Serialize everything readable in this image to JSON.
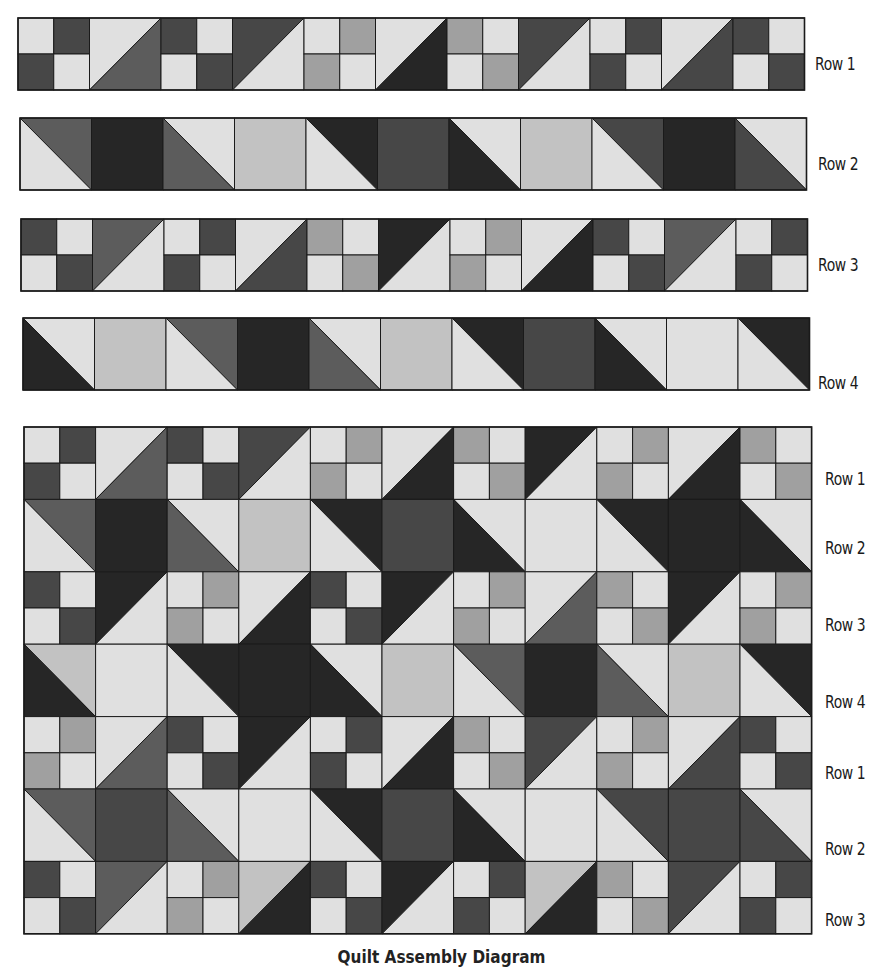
{
  "colors": {
    "L": "#e0e0e0",
    "S": "#c2c2c2",
    "M": "#a0a0a0",
    "G": "#5c5c5c",
    "D": "#474747",
    "K": "#262626",
    "outline": "#1a1a1a"
  },
  "strips": [
    {
      "label": "Row 1",
      "x": 18,
      "y": 18,
      "block": 71.5,
      "height": 72,
      "label_x": 815,
      "label_y": 66,
      "blocks": [
        {
          "t": "4p",
          "c": [
            "L",
            "D",
            "D",
            "L"
          ]
        },
        {
          "t": "hu",
          "c": [
            "L",
            "G"
          ]
        },
        {
          "t": "4p",
          "c": [
            "D",
            "L",
            "L",
            "D"
          ]
        },
        {
          "t": "hu",
          "c": [
            "D",
            "L"
          ]
        },
        {
          "t": "4p",
          "c": [
            "L",
            "M",
            "M",
            "L"
          ]
        },
        {
          "t": "hu",
          "c": [
            "L",
            "K"
          ]
        },
        {
          "t": "4p",
          "c": [
            "M",
            "L",
            "L",
            "M"
          ]
        },
        {
          "t": "hu",
          "c": [
            "D",
            "L"
          ]
        },
        {
          "t": "4p",
          "c": [
            "L",
            "D",
            "D",
            "L"
          ]
        },
        {
          "t": "hu",
          "c": [
            "L",
            "D"
          ]
        },
        {
          "t": "4p",
          "c": [
            "D",
            "L",
            "L",
            "D"
          ]
        }
      ]
    },
    {
      "label": "Row 2",
      "x": 20,
      "y": 118,
      "block": 71.5,
      "height": 72,
      "label_x": 818,
      "label_y": 166,
      "blocks": [
        {
          "t": "hd",
          "c": [
            "G",
            "L"
          ]
        },
        {
          "t": "sq",
          "c": [
            "K"
          ]
        },
        {
          "t": "hd",
          "c": [
            "L",
            "G"
          ]
        },
        {
          "t": "sq",
          "c": [
            "S"
          ]
        },
        {
          "t": "hd",
          "c": [
            "K",
            "L"
          ]
        },
        {
          "t": "sq",
          "c": [
            "D"
          ]
        },
        {
          "t": "hd",
          "c": [
            "L",
            "K"
          ]
        },
        {
          "t": "sq",
          "c": [
            "S"
          ]
        },
        {
          "t": "hd",
          "c": [
            "D",
            "L"
          ]
        },
        {
          "t": "sq",
          "c": [
            "K"
          ]
        },
        {
          "t": "hd",
          "c": [
            "L",
            "D"
          ]
        }
      ]
    },
    {
      "label": "Row 3",
      "x": 21,
      "y": 219,
      "block": 71.5,
      "height": 72,
      "label_x": 818,
      "label_y": 267,
      "blocks": [
        {
          "t": "4p",
          "c": [
            "D",
            "L",
            "L",
            "D"
          ]
        },
        {
          "t": "hu",
          "c": [
            "G",
            "L"
          ]
        },
        {
          "t": "4p",
          "c": [
            "L",
            "D",
            "D",
            "L"
          ]
        },
        {
          "t": "hu",
          "c": [
            "L",
            "D"
          ]
        },
        {
          "t": "4p",
          "c": [
            "M",
            "L",
            "L",
            "M"
          ]
        },
        {
          "t": "hu",
          "c": [
            "K",
            "L"
          ]
        },
        {
          "t": "4p",
          "c": [
            "L",
            "M",
            "M",
            "L"
          ]
        },
        {
          "t": "hu",
          "c": [
            "L",
            "K"
          ]
        },
        {
          "t": "4p",
          "c": [
            "D",
            "L",
            "L",
            "D"
          ]
        },
        {
          "t": "hu",
          "c": [
            "G",
            "L"
          ]
        },
        {
          "t": "4p",
          "c": [
            "L",
            "D",
            "D",
            "L"
          ]
        }
      ]
    },
    {
      "label": "Row 4",
      "x": 23,
      "y": 318,
      "block": 71.5,
      "height": 72,
      "label_x": 818,
      "label_y": 385,
      "blocks": [
        {
          "t": "hd",
          "c": [
            "L",
            "K"
          ]
        },
        {
          "t": "sq",
          "c": [
            "S"
          ]
        },
        {
          "t": "hd",
          "c": [
            "G",
            "L"
          ]
        },
        {
          "t": "sq",
          "c": [
            "K"
          ]
        },
        {
          "t": "hd",
          "c": [
            "L",
            "G"
          ]
        },
        {
          "t": "sq",
          "c": [
            "S"
          ]
        },
        {
          "t": "hd",
          "c": [
            "K",
            "L"
          ]
        },
        {
          "t": "sq",
          "c": [
            "D"
          ]
        },
        {
          "t": "hd",
          "c": [
            "L",
            "K"
          ]
        },
        {
          "t": "sq",
          "c": [
            "L"
          ]
        },
        {
          "t": "hd",
          "c": [
            "K",
            "L"
          ]
        }
      ]
    }
  ],
  "quilt": {
    "x": 24,
    "y": 427,
    "block": 71.6,
    "row_height": 72.4,
    "labels": [
      {
        "text": "Row 1",
        "y": 481
      },
      {
        "text": "Row 2",
        "y": 550
      },
      {
        "text": "Row 3",
        "y": 627
      },
      {
        "text": "Row 4",
        "y": 704
      },
      {
        "text": "Row 1",
        "y": 775
      },
      {
        "text": "Row 2",
        "y": 851
      },
      {
        "text": "Row 3",
        "y": 922
      }
    ],
    "label_x": 825,
    "rows": [
      [
        {
          "t": "4p",
          "c": [
            "L",
            "D",
            "D",
            "L"
          ]
        },
        {
          "t": "hu",
          "c": [
            "L",
            "G"
          ]
        },
        {
          "t": "4p",
          "c": [
            "D",
            "L",
            "L",
            "D"
          ]
        },
        {
          "t": "hu",
          "c": [
            "D",
            "L"
          ]
        },
        {
          "t": "4p",
          "c": [
            "L",
            "M",
            "M",
            "L"
          ]
        },
        {
          "t": "hu",
          "c": [
            "L",
            "K"
          ]
        },
        {
          "t": "4p",
          "c": [
            "M",
            "L",
            "L",
            "M"
          ]
        },
        {
          "t": "hu",
          "c": [
            "K",
            "L"
          ]
        },
        {
          "t": "4p",
          "c": [
            "L",
            "M",
            "M",
            "L"
          ]
        },
        {
          "t": "hu",
          "c": [
            "L",
            "K"
          ]
        },
        {
          "t": "4p",
          "c": [
            "M",
            "L",
            "L",
            "M"
          ]
        }
      ],
      [
        {
          "t": "hd",
          "c": [
            "G",
            "L"
          ]
        },
        {
          "t": "sq",
          "c": [
            "K"
          ]
        },
        {
          "t": "hd",
          "c": [
            "L",
            "G"
          ]
        },
        {
          "t": "sq",
          "c": [
            "S"
          ]
        },
        {
          "t": "hd",
          "c": [
            "K",
            "L"
          ]
        },
        {
          "t": "sq",
          "c": [
            "D"
          ]
        },
        {
          "t": "hd",
          "c": [
            "L",
            "K"
          ]
        },
        {
          "t": "sq",
          "c": [
            "L"
          ]
        },
        {
          "t": "hd",
          "c": [
            "K",
            "L"
          ]
        },
        {
          "t": "sq",
          "c": [
            "K"
          ]
        },
        {
          "t": "hd",
          "c": [
            "L",
            "K"
          ]
        }
      ],
      [
        {
          "t": "4p",
          "c": [
            "D",
            "L",
            "L",
            "D"
          ]
        },
        {
          "t": "hu",
          "c": [
            "K",
            "L"
          ]
        },
        {
          "t": "4p",
          "c": [
            "L",
            "M",
            "M",
            "L"
          ]
        },
        {
          "t": "hu",
          "c": [
            "L",
            "K"
          ]
        },
        {
          "t": "4p",
          "c": [
            "D",
            "L",
            "L",
            "D"
          ]
        },
        {
          "t": "hu",
          "c": [
            "K",
            "L"
          ]
        },
        {
          "t": "4p",
          "c": [
            "L",
            "M",
            "M",
            "L"
          ]
        },
        {
          "t": "hu",
          "c": [
            "L",
            "G"
          ]
        },
        {
          "t": "4p",
          "c": [
            "M",
            "L",
            "L",
            "M"
          ]
        },
        {
          "t": "hu",
          "c": [
            "K",
            "L"
          ]
        },
        {
          "t": "4p",
          "c": [
            "L",
            "M",
            "M",
            "L"
          ]
        }
      ],
      [
        {
          "t": "hd",
          "c": [
            "S",
            "K"
          ]
        },
        {
          "t": "sq",
          "c": [
            "L"
          ]
        },
        {
          "t": "hd",
          "c": [
            "K",
            "L"
          ]
        },
        {
          "t": "sq",
          "c": [
            "K"
          ]
        },
        {
          "t": "hd",
          "c": [
            "L",
            "K"
          ]
        },
        {
          "t": "sq",
          "c": [
            "S"
          ]
        },
        {
          "t": "hd",
          "c": [
            "G",
            "L"
          ]
        },
        {
          "t": "sq",
          "c": [
            "K"
          ]
        },
        {
          "t": "hd",
          "c": [
            "L",
            "G"
          ]
        },
        {
          "t": "sq",
          "c": [
            "S"
          ]
        },
        {
          "t": "hd",
          "c": [
            "K",
            "L"
          ]
        }
      ],
      [
        {
          "t": "4p",
          "c": [
            "L",
            "M",
            "M",
            "L"
          ]
        },
        {
          "t": "hu",
          "c": [
            "L",
            "G"
          ]
        },
        {
          "t": "4p",
          "c": [
            "D",
            "L",
            "L",
            "D"
          ]
        },
        {
          "t": "hu",
          "c": [
            "K",
            "L"
          ]
        },
        {
          "t": "4p",
          "c": [
            "L",
            "D",
            "D",
            "L"
          ]
        },
        {
          "t": "hu",
          "c": [
            "L",
            "K"
          ]
        },
        {
          "t": "4p",
          "c": [
            "M",
            "L",
            "L",
            "M"
          ]
        },
        {
          "t": "hu",
          "c": [
            "D",
            "L"
          ]
        },
        {
          "t": "4p",
          "c": [
            "L",
            "M",
            "M",
            "L"
          ]
        },
        {
          "t": "hu",
          "c": [
            "L",
            "D"
          ]
        },
        {
          "t": "4p",
          "c": [
            "D",
            "L",
            "L",
            "D"
          ]
        }
      ],
      [
        {
          "t": "hd",
          "c": [
            "G",
            "L"
          ]
        },
        {
          "t": "sq",
          "c": [
            "D"
          ]
        },
        {
          "t": "hd",
          "c": [
            "L",
            "G"
          ]
        },
        {
          "t": "sq",
          "c": [
            "L"
          ]
        },
        {
          "t": "hd",
          "c": [
            "K",
            "L"
          ]
        },
        {
          "t": "sq",
          "c": [
            "D"
          ]
        },
        {
          "t": "hd",
          "c": [
            "L",
            "K"
          ]
        },
        {
          "t": "sq",
          "c": [
            "L"
          ]
        },
        {
          "t": "hd",
          "c": [
            "D",
            "L"
          ]
        },
        {
          "t": "sq",
          "c": [
            "D"
          ]
        },
        {
          "t": "hd",
          "c": [
            "L",
            "D"
          ]
        }
      ],
      [
        {
          "t": "4p",
          "c": [
            "D",
            "L",
            "L",
            "D"
          ]
        },
        {
          "t": "hu",
          "c": [
            "G",
            "L"
          ]
        },
        {
          "t": "4p",
          "c": [
            "L",
            "M",
            "M",
            "L"
          ]
        },
        {
          "t": "hu",
          "c": [
            "S",
            "K"
          ]
        },
        {
          "t": "4p",
          "c": [
            "D",
            "L",
            "L",
            "D"
          ]
        },
        {
          "t": "hu",
          "c": [
            "K",
            "L"
          ]
        },
        {
          "t": "4p",
          "c": [
            "L",
            "D",
            "D",
            "L"
          ]
        },
        {
          "t": "hu",
          "c": [
            "S",
            "K"
          ]
        },
        {
          "t": "4p",
          "c": [
            "M",
            "L",
            "L",
            "M"
          ]
        },
        {
          "t": "hu",
          "c": [
            "D",
            "L"
          ]
        },
        {
          "t": "4p",
          "c": [
            "L",
            "D",
            "D",
            "L"
          ]
        }
      ]
    ]
  },
  "caption": "Quilt Assembly Diagram"
}
